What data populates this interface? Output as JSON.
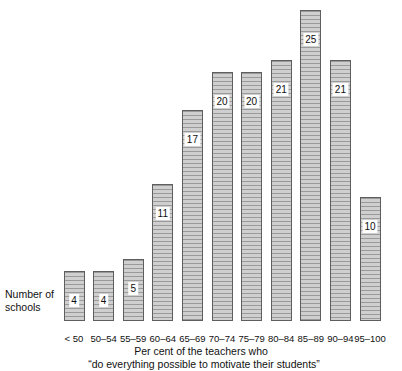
{
  "chart_data": {
    "type": "bar",
    "title": "",
    "subtitle": "",
    "xlabel": "Per cent of the teachers who “do everything possible to motivate their students”",
    "ylabel": "Number of schools",
    "categories": [
      "< 50",
      "50–54",
      "55–59",
      "60–64",
      "65–69",
      "70–74",
      "75–79",
      "80–84",
      "85–89",
      "90–94",
      "95–100"
    ],
    "values": [
      4,
      4,
      5,
      11,
      17,
      20,
      20,
      21,
      25,
      21,
      10
    ],
    "value_labels": [
      "4",
      "4",
      "5",
      "11",
      "17",
      "20",
      "20",
      "21",
      "25",
      "21",
      "10"
    ],
    "ylim": [
      0,
      25
    ],
    "grid": false,
    "legend": null,
    "bar_color": "#c9c9c9",
    "bar_edge_color": "#5e5e5e",
    "hatch": "horizontal-lines"
  },
  "axes": {
    "y_caption_line1": "Number of",
    "y_caption_line2": "schools",
    "x_caption_line1": "Per cent of the teachers who",
    "x_caption_line2": "“do everything possible to motivate their students”"
  },
  "x_ticks": [
    {
      "label": "< 50"
    },
    {
      "label": "50–54"
    },
    {
      "label": "55–59"
    },
    {
      "label": "60–64"
    },
    {
      "label": "65–69"
    },
    {
      "label": "70–74"
    },
    {
      "label": "75–79"
    },
    {
      "label": "80–84"
    },
    {
      "label": "85–89"
    },
    {
      "label": "90–94"
    },
    {
      "label": "95–100"
    }
  ],
  "bars": [
    {
      "label": "< 50",
      "value": 4,
      "value_text": "4"
    },
    {
      "label": "50–54",
      "value": 4,
      "value_text": "4"
    },
    {
      "label": "55–59",
      "value": 5,
      "value_text": "5"
    },
    {
      "label": "60–64",
      "value": 11,
      "value_text": "11"
    },
    {
      "label": "65–69",
      "value": 17,
      "value_text": "17"
    },
    {
      "label": "70–74",
      "value": 20,
      "value_text": "20"
    },
    {
      "label": "75–79",
      "value": 20,
      "value_text": "20"
    },
    {
      "label": "80–84",
      "value": 21,
      "value_text": "21"
    },
    {
      "label": "85–89",
      "value": 25,
      "value_text": "25"
    },
    {
      "label": "90–94",
      "value": 21,
      "value_text": "21"
    },
    {
      "label": "95–100",
      "value": 10,
      "value_text": "10"
    }
  ]
}
